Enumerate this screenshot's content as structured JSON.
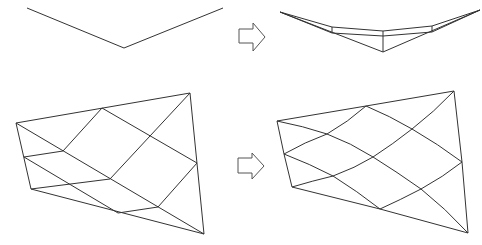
{
  "diagram": {
    "type": "mesh-smoothing-illustration",
    "panels": [
      {
        "name": "polyline-before",
        "points": [
          [
            27,
            8
          ],
          [
            124,
            48
          ],
          [
            223,
            8
          ]
        ]
      },
      {
        "name": "polyline-after",
        "outer_top": [
          [
            280,
            12
          ],
          [
            332,
            27
          ],
          [
            383,
            31
          ],
          [
            432,
            26
          ],
          [
            480,
            10
          ]
        ],
        "outer_mid": [
          [
            280,
            12
          ],
          [
            332,
            33
          ],
          [
            383,
            36
          ],
          [
            432,
            32
          ],
          [
            480,
            10
          ]
        ],
        "outer_bottom": [
          [
            280,
            12
          ],
          [
            383,
            52
          ],
          [
            480,
            10
          ]
        ],
        "verticals": [
          [
            [
              332,
              27
            ],
            [
              332,
              33
            ]
          ],
          [
            [
              383,
              31
            ],
            [
              383,
              52
            ]
          ],
          [
            [
              432,
              26
            ],
            [
              432,
              32
            ]
          ]
        ]
      },
      {
        "name": "quad-mesh-before",
        "corners": [
          [
            16,
            123
          ],
          [
            190,
            93
          ],
          [
            204,
            234
          ],
          [
            31,
            189
          ]
        ]
      },
      {
        "name": "quad-mesh-after",
        "corners": [
          [
            277,
            121
          ],
          [
            454,
            91
          ],
          [
            468,
            233
          ],
          [
            292,
            187
          ]
        ]
      }
    ],
    "arrows": [
      {
        "name": "arrow-top",
        "direction": "right"
      },
      {
        "name": "arrow-bottom",
        "direction": "right"
      }
    ],
    "colors": {
      "line": "#333333",
      "arrow_outline": "#555555",
      "background": "#ffffff"
    }
  },
  "caption": {
    "text": ""
  }
}
